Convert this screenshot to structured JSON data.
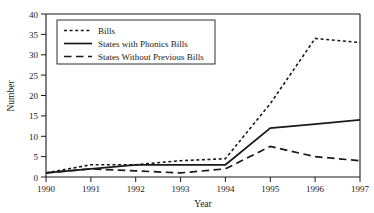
{
  "chart_data": {
    "type": "line",
    "title": "",
    "xlabel": "Year",
    "ylabel": "Number",
    "x": [
      1990,
      1991,
      1992,
      1993,
      1994,
      1995,
      1996,
      1997
    ],
    "categories": [
      "1990",
      "1991",
      "1992",
      "1993",
      "1994",
      "1995",
      "1996",
      "1997"
    ],
    "xlim": [
      1990,
      1997
    ],
    "ylim": [
      0,
      40
    ],
    "yticks": [
      0,
      5,
      10,
      15,
      20,
      25,
      30,
      35,
      40
    ],
    "ytick_labels": [
      "0",
      "5",
      "10",
      "15",
      "20",
      "25",
      "30",
      "35",
      "40"
    ],
    "xticks": [
      1990,
      1991,
      1992,
      1993,
      1994,
      1995,
      1996,
      1997
    ],
    "xtick_labels": [
      "1990",
      "1991",
      "1992",
      "1993",
      "1994",
      "1995",
      "1996",
      "1997"
    ],
    "grid": false,
    "legend_position": "upper left",
    "series": [
      {
        "name": "Bills",
        "style": "dotted",
        "color": "#1a1a1a",
        "values": [
          1,
          3,
          3,
          4,
          4.5,
          18,
          34,
          33
        ]
      },
      {
        "name": "States with Phonics Bills",
        "style": "solid",
        "color": "#1a1a1a",
        "values": [
          1,
          2,
          3,
          3,
          3,
          12,
          13,
          14
        ]
      },
      {
        "name": "States Without Previous Bills",
        "style": "dashed",
        "color": "#1a1a1a",
        "values": [
          1,
          2,
          1.5,
          1,
          2,
          7.5,
          5,
          4
        ]
      }
    ]
  },
  "axis": {
    "y_title": "Number",
    "x_title": "Year",
    "y_labels": [
      "40",
      "35",
      "30",
      "25",
      "20",
      "15",
      "10",
      "5",
      "0"
    ],
    "x_labels": [
      "1990",
      "1991",
      "1992",
      "1993",
      "1994",
      "1995",
      "1996",
      "1997"
    ]
  },
  "legend": {
    "entries": [
      {
        "label": "Bills",
        "style": "dotted"
      },
      {
        "label": "States with Phonics Bills",
        "style": "solid"
      },
      {
        "label": "States Without Previous Bills",
        "style": "dashed"
      }
    ]
  },
  "colors": {
    "ink": "#1a1a1a",
    "background": "#ffffff"
  }
}
